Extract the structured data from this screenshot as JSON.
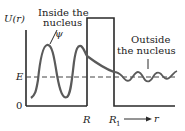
{
  "diagram": {
    "y_axis_label": "U(r)",
    "origin_label": "0",
    "energy_label": "E",
    "inside_label_line1": "Inside the",
    "inside_label_line2": "nucleus",
    "wavefunction_label": "ψ",
    "outside_label_line1": "Outside",
    "outside_label_line2": "the nucleus",
    "r_label_R": "R",
    "r_label_R1": "R",
    "r_label_R1_sub": "1",
    "x_axis_label": "r",
    "colors": {
      "axes": "#2a2a2a",
      "wave": "#5a5a5a",
      "dashed": "#444444",
      "background": "#ffffff"
    }
  }
}
